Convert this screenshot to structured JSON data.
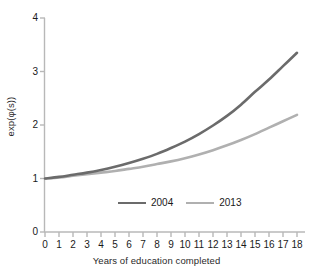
{
  "chart_data": {
    "type": "line",
    "title": "",
    "subtitle": "",
    "xlabel": "Years of education completed",
    "ylabel": "exp(φ(s))",
    "xlim": [
      0,
      18
    ],
    "ylim": [
      0,
      4
    ],
    "grid": false,
    "legend_position": "bottom-center-inside",
    "xticks": [
      "0",
      "1",
      "2",
      "3",
      "4",
      "5",
      "6",
      "7",
      "8",
      "9",
      "10",
      "11",
      "12",
      "13",
      "14",
      "15",
      "16",
      "17",
      "18"
    ],
    "yticks": [
      "0",
      "1",
      "2",
      "3",
      "4"
    ],
    "x": [
      0,
      1,
      2,
      3,
      4,
      5,
      6,
      7,
      8,
      9,
      10,
      11,
      12,
      13,
      14,
      15,
      16,
      17,
      18
    ],
    "series": [
      {
        "name": "2004",
        "color": "#6b6b6b",
        "values": [
          1.0,
          1.03,
          1.07,
          1.11,
          1.16,
          1.22,
          1.29,
          1.37,
          1.46,
          1.57,
          1.69,
          1.83,
          1.99,
          2.17,
          2.38,
          2.62,
          2.85,
          3.1,
          3.35
        ]
      },
      {
        "name": "2013",
        "color": "#b0b0b0",
        "values": [
          1.0,
          1.02,
          1.05,
          1.08,
          1.11,
          1.14,
          1.18,
          1.22,
          1.27,
          1.32,
          1.38,
          1.45,
          1.53,
          1.62,
          1.72,
          1.83,
          1.95,
          2.07,
          2.19
        ]
      }
    ],
    "axis_color": "#b8b8b8",
    "text_color": "#1a1a1a"
  },
  "axes": {
    "ylabel_text": "exp(φ(s))",
    "xlabel_text": "Years of education completed"
  },
  "legend": {
    "entries": [
      {
        "label": "2004",
        "color": "#6b6b6b"
      },
      {
        "label": "2013",
        "color": "#b0b0b0"
      }
    ]
  }
}
